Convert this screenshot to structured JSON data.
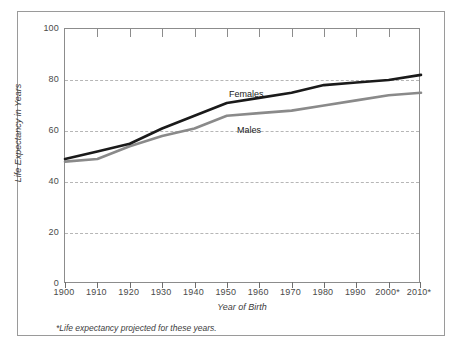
{
  "chart_data": {
    "type": "line",
    "title": "",
    "xlabel": "Year of Birth",
    "ylabel": "Life Expectancy in Years",
    "xlim": [
      1900,
      2010
    ],
    "ylim": [
      0,
      100
    ],
    "grid": true,
    "legend_position": "inline-on-lines",
    "categories": [
      1900,
      1910,
      1920,
      1930,
      1940,
      1950,
      1960,
      1970,
      1980,
      1990,
      2000,
      2010
    ],
    "xtick_labels": [
      "1900",
      "1910",
      "1920",
      "1930",
      "1940",
      "1950",
      "1960",
      "1970",
      "1980",
      "1990",
      "2000*",
      "2010*"
    ],
    "ytick_labels": [
      "0",
      "20",
      "40",
      "60",
      "80",
      "100"
    ],
    "ytick_values": [
      0,
      20,
      40,
      60,
      80,
      100
    ],
    "series": [
      {
        "name": "Females",
        "color": "#1a1a1a",
        "values": [
          49,
          52,
          55,
          61,
          66,
          71,
          73,
          75,
          78,
          79,
          80,
          82
        ]
      },
      {
        "name": "Males",
        "color": "#8a8a8a",
        "values": [
          48,
          49,
          54,
          58,
          61,
          66,
          67,
          68,
          70,
          72,
          74,
          75
        ]
      }
    ],
    "annotations": [
      {
        "text": "Females",
        "x": 1950,
        "y": 78
      },
      {
        "text": "Males",
        "x": 1953,
        "y": 66
      }
    ],
    "footnote": "*Life expectancy projected for these years."
  },
  "colors": {
    "females_line": "#1a1a1a",
    "males_line": "#8a8a8a",
    "gridline": "#b6b6b6",
    "axis": "#8c8c8c",
    "frame": "#9a9a9a",
    "text": "#3c3c3c",
    "background": "#ffffff"
  }
}
